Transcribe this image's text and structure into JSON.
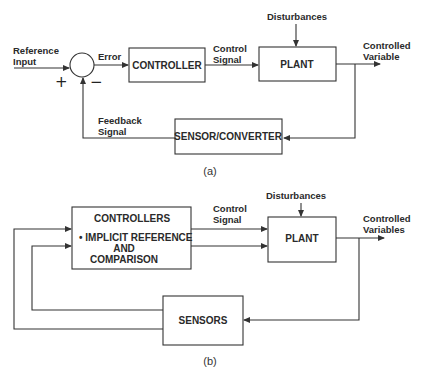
{
  "diagram_a": {
    "caption": "(a)",
    "reference_input": [
      "Reference",
      "Input"
    ],
    "error": "Error",
    "plus": "+",
    "minus": "−",
    "controller": "CONTROLLER",
    "control_signal": [
      "Control",
      "Signal"
    ],
    "plant": "PLANT",
    "disturbances": "Disturbances",
    "controlled_variable": [
      "Controlled",
      "Variable"
    ],
    "sensor": "SENSOR/CONVERTER",
    "feedback_signal": [
      "Feedback",
      "Signal"
    ]
  },
  "diagram_b": {
    "caption": "(b)",
    "controllers": "CONTROLLERS",
    "controllers_note": [
      "• IMPLICIT REFERENCE",
      "AND",
      "COMPARISON"
    ],
    "control_signal": [
      "Control",
      "Signal"
    ],
    "plant": "PLANT",
    "disturbances": "Disturbances",
    "controlled_variables": [
      "Controlled",
      "Variables"
    ],
    "sensors": "SENSORS"
  },
  "colors": {
    "line": "#333333",
    "text": "#2a2a2a",
    "background": "#ffffff"
  }
}
